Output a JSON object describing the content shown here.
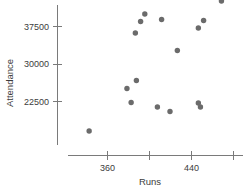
{
  "chart_data": {
    "type": "scatter",
    "title": "",
    "xlabel": "Runs",
    "ylabel": "Attendance",
    "xlim": [
      340,
      488
    ],
    "ylim": [
      14500,
      41000
    ],
    "grid": false,
    "legend": null,
    "x_ticks": [
      {
        "value": 360,
        "label": "360"
      },
      {
        "value": 400,
        "label": ""
      },
      {
        "value": 440,
        "label": "440"
      },
      {
        "value": 480,
        "label": ""
      }
    ],
    "y_ticks": [
      {
        "value": 22500,
        "label": "22500"
      },
      {
        "value": 30000,
        "label": "30000"
      },
      {
        "value": 37500,
        "label": "37500"
      }
    ],
    "series": [
      {
        "name": "teams",
        "marker": "circle",
        "color": "#6b6b6b",
        "points": [
          {
            "x": 396,
            "y": 39900
          },
          {
            "x": 469,
            "y": 42500
          },
          {
            "x": 412,
            "y": 38800
          },
          {
            "x": 392,
            "y": 38400
          },
          {
            "x": 452,
            "y": 38600
          },
          {
            "x": 447,
            "y": 37100
          },
          {
            "x": 387,
            "y": 36100
          },
          {
            "x": 427,
            "y": 32600
          },
          {
            "x": 388,
            "y": 26600
          },
          {
            "x": 379,
            "y": 25000
          },
          {
            "x": 383,
            "y": 22200
          },
          {
            "x": 408,
            "y": 21300
          },
          {
            "x": 420,
            "y": 20400
          },
          {
            "x": 447,
            "y": 22100
          },
          {
            "x": 449,
            "y": 21300
          },
          {
            "x": 343,
            "y": 16500
          }
        ]
      }
    ]
  },
  "axis_titles": {
    "x": "Runs",
    "y": "Attendance"
  }
}
